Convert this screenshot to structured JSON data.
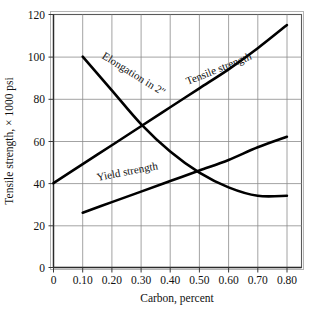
{
  "chart_data": {
    "type": "line",
    "title": "",
    "xlabel": "Carbon, percent",
    "ylabel": "Tensile strength, × 1000 psi",
    "xlim": [
      0,
      0.85
    ],
    "ylim": [
      0,
      120
    ],
    "grid": true,
    "legend_position": "inline-labels",
    "xticks": [
      "0",
      "0.10",
      "0.20",
      "0.30",
      "0.40",
      "0.50",
      "0.60",
      "0.70",
      "0.80"
    ],
    "xtick_values": [
      0,
      0.1,
      0.2,
      0.3,
      0.4,
      0.5,
      0.6,
      0.7,
      0.8
    ],
    "yticks": [
      "0",
      "20",
      "40",
      "60",
      "80",
      "100",
      "120"
    ],
    "ytick_values": [
      0,
      20,
      40,
      60,
      80,
      100,
      120
    ],
    "series": [
      {
        "name": "Tensile strength",
        "label": "Tensile strength",
        "x": [
          0.0,
          0.1,
          0.2,
          0.3,
          0.4,
          0.5,
          0.6,
          0.7,
          0.8
        ],
        "values": [
          40,
          49,
          58,
          67,
          76,
          85,
          94,
          104,
          115
        ]
      },
      {
        "name": "Elongation in 2\"",
        "label": "Elongation in 2″",
        "x": [
          0.1,
          0.2,
          0.3,
          0.4,
          0.5,
          0.6,
          0.7,
          0.8
        ],
        "values": [
          100,
          84,
          68,
          55,
          45,
          38,
          34,
          34
        ]
      },
      {
        "name": "Yield strength",
        "label": "Yield strength",
        "x": [
          0.1,
          0.2,
          0.3,
          0.4,
          0.5,
          0.6,
          0.7,
          0.8
        ],
        "values": [
          26,
          31,
          36,
          41,
          46,
          51,
          57,
          62
        ]
      }
    ]
  },
  "labels": {
    "tensile": "Tensile strength",
    "elongation": "Elongation in 2″",
    "yield": "Yield strength",
    "x_axis_title": "Carbon, percent",
    "y_axis_title": "Tensile strength, × 1000 psi",
    "x0": "0",
    "x1": "0.10",
    "x2": "0.20",
    "x3": "0.30",
    "x4": "0.40",
    "x5": "0.50",
    "x6": "0.60",
    "x7": "0.70",
    "x8": "0.80",
    "y0": "0",
    "y1": "20",
    "y2": "40",
    "y3": "60",
    "y4": "80",
    "y5": "100",
    "y6": "120"
  },
  "colors": {
    "curve": "#000000",
    "grid": "#8c8c8c",
    "frame": "#5a5a5a",
    "background": "#ffffff",
    "text": "#111111"
  }
}
